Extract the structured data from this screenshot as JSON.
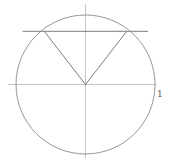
{
  "diagram": {
    "type": "unit-circle",
    "colors": {
      "circle": "#8a8a8a",
      "axes": "#b8b8b8",
      "chord": "#6e6e6e",
      "radii": "#6e6e6e",
      "label": "#555555"
    },
    "center": [
      85.5,
      84.5
    ],
    "radius": 69.5,
    "axes": {
      "horizontal": {
        "x1": 8,
        "x2": 157,
        "y": 84.5
      },
      "vertical": {
        "x": 85.5,
        "y1": 4,
        "y2": 158
      }
    },
    "chord": {
      "x1": 22.5,
      "x2": 148,
      "y": 31.3
    },
    "radii_endpoints": [
      [
        44.3,
        31.3
      ],
      [
        126.7,
        31.3
      ]
    ],
    "unit_label": {
      "text": "1",
      "x": 157,
      "y": 97
    }
  }
}
